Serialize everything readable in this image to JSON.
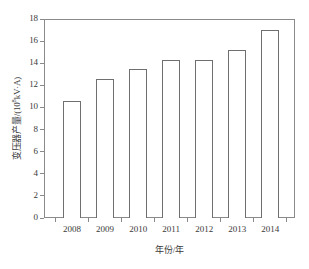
{
  "chart_data": {
    "type": "bar",
    "title": "",
    "subtitle": "",
    "xlabel": "年份/年",
    "ylabel": "变压器产量/(10⁸kV·A)",
    "ylabel_parts": {
      "prefix": "变压器产量/(10",
      "exponent": "8",
      "suffix": "kV·A)"
    },
    "categories": [
      "2008",
      "2009",
      "2010",
      "2011",
      "2012",
      "2013",
      "2014"
    ],
    "values": [
      10.6,
      12.6,
      13.5,
      14.3,
      14.3,
      15.2,
      17.0
    ],
    "series": [
      {
        "name": "变压器产量",
        "values": [
          10.6,
          12.6,
          13.5,
          14.3,
          14.3,
          15.2,
          17.0
        ]
      }
    ],
    "ylim": [
      0,
      18
    ],
    "xlim_categories": 7,
    "yticks": [
      0,
      2,
      4,
      6,
      8,
      10,
      12,
      14,
      16,
      18
    ],
    "ytick_labels": [
      "0",
      "2",
      "4",
      "6",
      "8",
      "10",
      "12",
      "14",
      "16",
      "18"
    ],
    "grid": false,
    "legend": null,
    "legend_position": "none",
    "bar_fill": "#ffffff",
    "bar_edge_color": "#6f6f6f",
    "axis_color": "#8a8a8a",
    "text_color": "#3a3a3a",
    "background": "#ffffff",
    "annotations": []
  }
}
